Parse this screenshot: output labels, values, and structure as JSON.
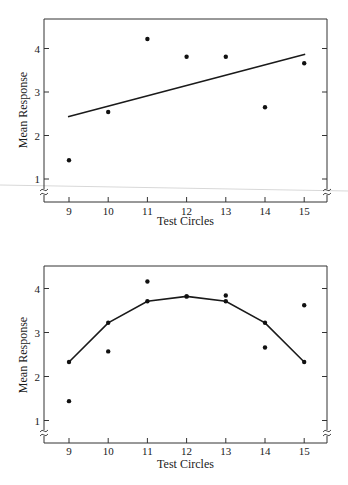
{
  "chart_data": [
    {
      "type": "scatter",
      "title": "",
      "xlabel": "Test Circles",
      "ylabel": "Mean Response",
      "x": [
        9,
        10,
        11,
        12,
        13,
        14,
        15
      ],
      "xticks": [
        "9",
        "10",
        "11",
        "12",
        "13",
        "14",
        "15"
      ],
      "yticks": [
        "1",
        "2",
        "3",
        "4"
      ],
      "xlim": [
        8.4,
        15.6
      ],
      "ylim": [
        0.45,
        4.7
      ],
      "grid": false,
      "axis_break": true,
      "series": [
        {
          "name": "Observed mean response",
          "style": "points",
          "values": [
            1.43,
            2.54,
            4.22,
            3.81,
            3.81,
            2.65,
            3.66
          ]
        },
        {
          "name": "Linear fit",
          "style": "line",
          "values": [
            2.43,
            2.67,
            2.91,
            3.15,
            3.39,
            3.63,
            3.87
          ]
        }
      ]
    },
    {
      "type": "scatter",
      "title": "",
      "xlabel": "Test Circles",
      "ylabel": "Mean Response",
      "x": [
        9,
        10,
        11,
        12,
        13,
        14,
        15
      ],
      "xticks": [
        "9",
        "10",
        "11",
        "12",
        "13",
        "14",
        "15"
      ],
      "yticks": [
        "1",
        "2",
        "3",
        "4"
      ],
      "xlim": [
        8.4,
        15.6
      ],
      "ylim": [
        0.45,
        4.7
      ],
      "grid": false,
      "axis_break": true,
      "series": [
        {
          "name": "Observed mean response",
          "style": "points",
          "values": [
            1.44,
            2.57,
            4.16,
            3.82,
            3.84,
            2.66,
            3.62
          ]
        },
        {
          "name": "Quadratic fit",
          "style": "line-with-markers",
          "values": [
            2.33,
            3.22,
            3.71,
            3.82,
            3.71,
            3.22,
            2.33
          ]
        }
      ]
    }
  ]
}
